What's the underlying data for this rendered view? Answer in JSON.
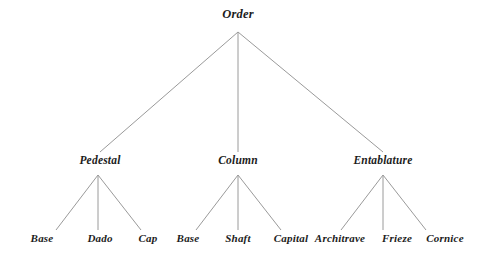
{
  "diagram": {
    "type": "hierarchy-tree",
    "title": "Order",
    "canvas": {
      "width": 481,
      "height": 258,
      "background": "#ffffff"
    },
    "edge_color": "#9a9a9a",
    "text_color": "#1c1c1c",
    "levels": 3,
    "nodes": [
      {
        "id": "order",
        "label": "Order",
        "level": "root",
        "x": 238,
        "y": 22,
        "apex_y": 32,
        "parent": null
      },
      {
        "id": "pedestal",
        "label": "Pedestal",
        "level": "middle",
        "x": 100,
        "y": 166,
        "apex_y": 175,
        "parent": "order"
      },
      {
        "id": "column",
        "label": "Column",
        "level": "middle",
        "x": 238,
        "y": 166,
        "apex_y": 175,
        "parent": "order"
      },
      {
        "id": "entablature",
        "label": "Entablature",
        "level": "middle",
        "x": 383,
        "y": 166,
        "apex_y": 175,
        "parent": "order"
      },
      {
        "id": "base-ped",
        "label": "Base",
        "level": "leaf",
        "x": 42,
        "y": 244,
        "parent": "pedestal"
      },
      {
        "id": "dado",
        "label": "Dado",
        "level": "leaf",
        "x": 100,
        "y": 244,
        "parent": "pedestal"
      },
      {
        "id": "cap",
        "label": "Cap",
        "level": "leaf",
        "x": 148,
        "y": 244,
        "parent": "pedestal"
      },
      {
        "id": "base-col",
        "label": "Base",
        "level": "leaf",
        "x": 188,
        "y": 244,
        "parent": "column"
      },
      {
        "id": "shaft",
        "label": "Shaft",
        "level": "leaf",
        "x": 238,
        "y": 244,
        "parent": "column"
      },
      {
        "id": "capital",
        "label": "Capital",
        "level": "leaf",
        "x": 291,
        "y": 244,
        "parent": "column"
      },
      {
        "id": "architrave",
        "label": "Architrave",
        "level": "leaf",
        "x": 340,
        "y": 244,
        "parent": "entablature"
      },
      {
        "id": "frieze",
        "label": "Frieze",
        "level": "leaf",
        "x": 397,
        "y": 244,
        "parent": "entablature"
      },
      {
        "id": "cornice",
        "label": "Cornice",
        "level": "leaf",
        "x": 445,
        "y": 244,
        "parent": "entablature"
      }
    ],
    "edges": [
      {
        "from": "order",
        "to": "pedestal",
        "x1": 238,
        "y1": 32,
        "x2": 100,
        "y2": 152
      },
      {
        "from": "order",
        "to": "column",
        "x1": 238,
        "y1": 32,
        "x2": 238,
        "y2": 152
      },
      {
        "from": "order",
        "to": "entablature",
        "x1": 238,
        "y1": 32,
        "x2": 383,
        "y2": 152
      },
      {
        "from": "pedestal",
        "to": "base-ped",
        "x1": 98,
        "y1": 175,
        "x2": 56,
        "y2": 230
      },
      {
        "from": "pedestal",
        "to": "dado",
        "x1": 98,
        "y1": 175,
        "x2": 98,
        "y2": 230
      },
      {
        "from": "pedestal",
        "to": "cap",
        "x1": 98,
        "y1": 175,
        "x2": 141,
        "y2": 230
      },
      {
        "from": "column",
        "to": "base-col",
        "x1": 238,
        "y1": 175,
        "x2": 196,
        "y2": 230
      },
      {
        "from": "column",
        "to": "shaft",
        "x1": 238,
        "y1": 175,
        "x2": 238,
        "y2": 230
      },
      {
        "from": "column",
        "to": "capital",
        "x1": 238,
        "y1": 175,
        "x2": 281,
        "y2": 230
      },
      {
        "from": "entablature",
        "to": "architrave",
        "x1": 383,
        "y1": 175,
        "x2": 341,
        "y2": 230
      },
      {
        "from": "entablature",
        "to": "frieze",
        "x1": 383,
        "y1": 175,
        "x2": 383,
        "y2": 230
      },
      {
        "from": "entablature",
        "to": "cornice",
        "x1": 383,
        "y1": 175,
        "x2": 426,
        "y2": 230
      }
    ]
  }
}
